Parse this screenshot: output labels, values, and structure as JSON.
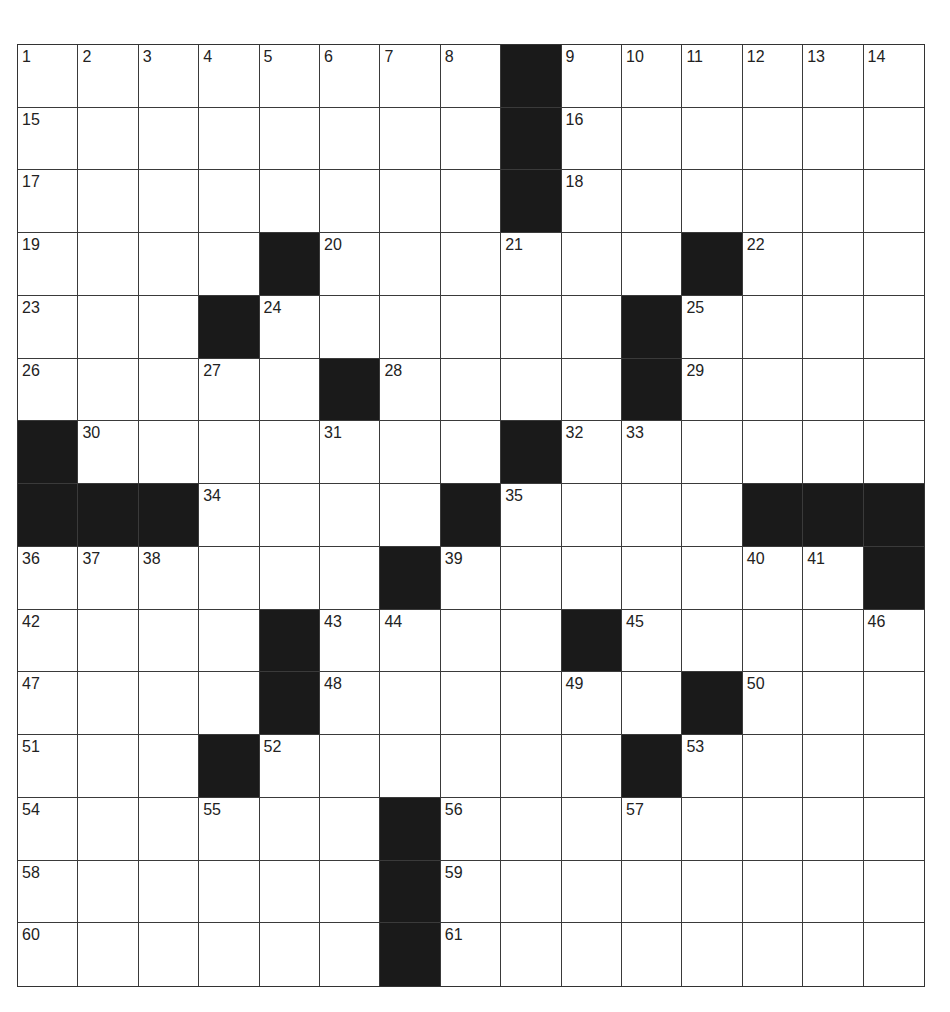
{
  "puzzle": {
    "rows": 15,
    "cols": 15,
    "colors": {
      "block": "#1a1a1a",
      "cell": "#ffffff",
      "line": "#3a3a3a"
    },
    "grid": [
      [
        "1",
        "2",
        "3",
        "4",
        "5",
        "6",
        "7",
        "8",
        "#",
        "9",
        "10",
        "11",
        "12",
        "13",
        "14"
      ],
      [
        "15",
        ".",
        ".",
        ".",
        ".",
        ".",
        ".",
        ".",
        "#",
        "16",
        ".",
        ".",
        ".",
        ".",
        "."
      ],
      [
        "17",
        ".",
        ".",
        ".",
        ".",
        ".",
        ".",
        ".",
        "#",
        "18",
        ".",
        ".",
        ".",
        ".",
        "."
      ],
      [
        "19",
        ".",
        ".",
        ".",
        "#",
        "20",
        ".",
        ".",
        "21",
        ".",
        ".",
        "#",
        "22",
        ".",
        "."
      ],
      [
        "23",
        ".",
        ".",
        "#",
        "24",
        ".",
        ".",
        ".",
        ".",
        ".",
        "#",
        "25",
        ".",
        ".",
        "."
      ],
      [
        "26",
        ".",
        ".",
        "27",
        ".",
        "#",
        "28",
        ".",
        ".",
        ".",
        "#",
        "29",
        ".",
        ".",
        "."
      ],
      [
        "#",
        "30",
        ".",
        ".",
        ".",
        "31",
        ".",
        ".",
        "#",
        "32",
        "33",
        ".",
        ".",
        ".",
        "."
      ],
      [
        "#",
        "#",
        "#",
        "34",
        ".",
        ".",
        ".",
        "#",
        "35",
        ".",
        ".",
        ".",
        "#",
        "#",
        "#"
      ],
      [
        "36",
        "37",
        "38",
        ".",
        ".",
        ".",
        "#",
        "39",
        ".",
        ".",
        ".",
        ".",
        "40",
        "41",
        "#"
      ],
      [
        "42",
        ".",
        ".",
        ".",
        "#",
        "43",
        "44",
        ".",
        ".",
        "#",
        "45",
        ".",
        ".",
        ".",
        "46"
      ],
      [
        "47",
        ".",
        ".",
        ".",
        "#",
        "48",
        ".",
        ".",
        ".",
        "49",
        ".",
        "#",
        "50",
        ".",
        "."
      ],
      [
        "51",
        ".",
        ".",
        "#",
        "52",
        ".",
        ".",
        ".",
        ".",
        ".",
        "#",
        "53",
        ".",
        ".",
        "."
      ],
      [
        "54",
        ".",
        ".",
        "55",
        ".",
        ".",
        "#",
        "56",
        ".",
        ".",
        "57",
        ".",
        ".",
        ".",
        "."
      ],
      [
        "58",
        ".",
        ".",
        ".",
        ".",
        ".",
        "#",
        "59",
        ".",
        ".",
        ".",
        ".",
        ".",
        ".",
        "."
      ],
      [
        "60",
        ".",
        ".",
        ".",
        ".",
        ".",
        "#",
        "61",
        ".",
        ".",
        ".",
        ".",
        ".",
        ".",
        "."
      ]
    ],
    "entries": {}
  }
}
